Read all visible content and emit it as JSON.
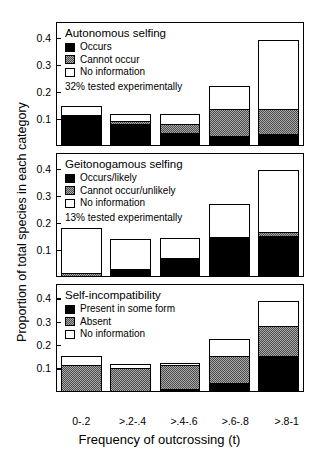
{
  "axes": {
    "ylabel": "Proportion of total species in each category",
    "xlabel": "Frequency of outcrossing (t)",
    "yticks": [
      "0.1",
      "0.2",
      "0.3",
      "0.4"
    ],
    "xticks": [
      "0-.2",
      ">.2-.4",
      ">.4-.6",
      ">.6-.8",
      ">.8-1"
    ]
  },
  "panels": [
    {
      "id": "autonomous-selfing",
      "title": "Autonomous selfing",
      "legend": [
        {
          "label": "Occurs",
          "fill": "black"
        },
        {
          "label": "Cannot occur",
          "fill": "gray"
        },
        {
          "label": "No information",
          "fill": "white"
        }
      ],
      "note": "32% tested experimentally"
    },
    {
      "id": "geitonogamous-selfing",
      "title": "Geitonogamous selfing",
      "legend": [
        {
          "label": "Occurs/likely",
          "fill": "black"
        },
        {
          "label": "Cannot occur/unlikely",
          "fill": "gray"
        },
        {
          "label": "No information",
          "fill": "white"
        }
      ],
      "note": "13% tested experimentally"
    },
    {
      "id": "self-incompatibility",
      "title": "Self-incompatibility",
      "legend": [
        {
          "label": "Present in some form",
          "fill": "black"
        },
        {
          "label": "Absent",
          "fill": "gray"
        },
        {
          "label": "No information",
          "fill": "white"
        }
      ],
      "note": ""
    }
  ],
  "chart_data": [
    {
      "type": "bar",
      "title": "Autonomous selfing",
      "stacked": true,
      "xlabel": "Frequency of outcrossing (t)",
      "ylabel": "Proportion of total species in each category",
      "ylim": [
        0,
        0.45
      ],
      "yticks": [
        0.1,
        0.2,
        0.3,
        0.4
      ],
      "grid": false,
      "legend_position": "top-left",
      "categories": [
        "0-.2",
        ">.2-.4",
        ">.4-.6",
        ">.6-.8",
        ">.8-1"
      ],
      "series": [
        {
          "name": "Occurs",
          "fill": "black",
          "values": [
            0.113,
            0.082,
            0.047,
            0.033,
            0.04
          ]
        },
        {
          "name": "Cannot occur",
          "fill": "gray",
          "values": [
            0.0,
            0.011,
            0.033,
            0.102,
            0.095
          ]
        },
        {
          "name": "No information",
          "fill": "white",
          "values": [
            0.033,
            0.022,
            0.036,
            0.086,
            0.255
          ]
        }
      ],
      "totals": [
        0.146,
        0.115,
        0.116,
        0.221,
        0.39
      ],
      "annotation": "32% tested experimentally"
    },
    {
      "type": "bar",
      "title": "Geitonogamous selfing",
      "stacked": true,
      "xlabel": "Frequency of outcrossing (t)",
      "ylabel": "Proportion of total species in each category",
      "ylim": [
        0,
        0.45
      ],
      "yticks": [
        0.1,
        0.2,
        0.3,
        0.4
      ],
      "grid": false,
      "legend_position": "top-left",
      "categories": [
        "0-.2",
        ">.2-.4",
        ">.4-.6",
        ">.6-.8",
        ">.8-1"
      ],
      "series": [
        {
          "name": "Occurs/likely",
          "fill": "black",
          "values": [
            0.0,
            0.025,
            0.069,
            0.146,
            0.149
          ]
        },
        {
          "name": "Cannot occur/unlikely",
          "fill": "gray",
          "values": [
            0.011,
            0.0,
            0.0,
            0.0,
            0.015
          ]
        },
        {
          "name": "No information",
          "fill": "white",
          "values": [
            0.167,
            0.113,
            0.073,
            0.123,
            0.229
          ]
        }
      ],
      "totals": [
        0.178,
        0.138,
        0.142,
        0.269,
        0.393
      ],
      "annotation": "13% tested experimentally"
    },
    {
      "type": "bar",
      "title": "Self-incompatibility",
      "stacked": true,
      "xlabel": "Frequency of outcrossing (t)",
      "ylabel": "Proportion of total species in each category",
      "ylim": [
        0,
        0.45
      ],
      "yticks": [
        0.1,
        0.2,
        0.3,
        0.4
      ],
      "grid": false,
      "legend_position": "top-left",
      "categories": [
        "0-.2",
        ">.2-.4",
        ">.4-.6",
        ">.6-.8",
        ">.8-1"
      ],
      "series": [
        {
          "name": "Present in some form",
          "fill": "black",
          "values": [
            0.0,
            0.0,
            0.011,
            0.036,
            0.153
          ]
        },
        {
          "name": "Absent",
          "fill": "gray",
          "values": [
            0.116,
            0.102,
            0.106,
            0.116,
            0.127
          ]
        },
        {
          "name": "No information",
          "fill": "white",
          "values": [
            0.033,
            0.015,
            0.004,
            0.069,
            0.106
          ]
        }
      ],
      "totals": [
        0.149,
        0.117,
        0.121,
        0.221,
        0.386
      ],
      "annotation": ""
    }
  ]
}
